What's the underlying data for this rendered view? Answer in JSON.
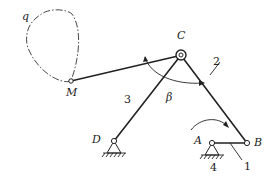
{
  "diagram": {
    "type": "four-bar linkage mechanism",
    "points": {
      "A": {
        "label": "A",
        "x": 212,
        "y": 143
      },
      "B": {
        "label": "B",
        "x": 247,
        "y": 143
      },
      "C": {
        "label": "C",
        "x": 181,
        "y": 55
      },
      "D": {
        "label": "D",
        "x": 114,
        "y": 141
      },
      "M": {
        "label": "M",
        "x": 71,
        "y": 81
      }
    },
    "links": [
      {
        "number": "1",
        "from": "A",
        "to": "B",
        "name": "crank"
      },
      {
        "number": "2",
        "from": "B",
        "to": "C",
        "name": "coupler"
      },
      {
        "number": "3",
        "from": "C",
        "to": "D",
        "name": "rocker"
      },
      {
        "number": "4",
        "name": "frame"
      }
    ],
    "coupler_point_path_label": "q",
    "angle_label": "β",
    "labels": {
      "q": "q",
      "M": "M",
      "C": "C",
      "D": "D",
      "A": "A",
      "B": "B",
      "beta": "β",
      "n1": "1",
      "n2": "2",
      "n3": "3",
      "n4": "4"
    }
  }
}
